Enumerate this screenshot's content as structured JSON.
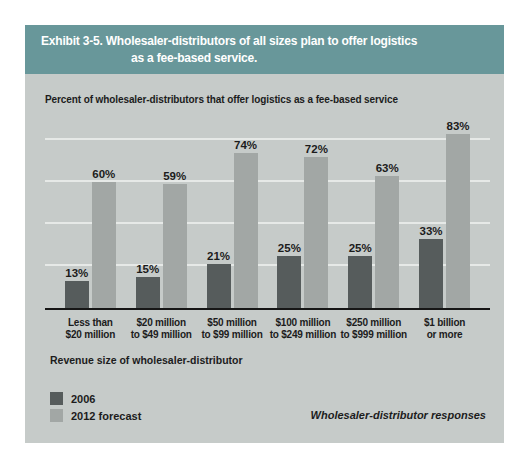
{
  "exhibit": {
    "title_line1": "Exhibit 3-5. Wholesaler-distributors of all sizes plan to offer logistics",
    "title_line2": "as a fee-based service."
  },
  "subtitle": "Percent of wholesaler-distributors that offer logistics as a fee-based service",
  "note": "Wholesaler-distributor responses",
  "colors": {
    "header_bg": "#68979a",
    "header_text": "#ffffff",
    "panel_bg": "#c6cbc9",
    "bar_2006": "#565c5c",
    "bar_2012_forecast": "#a2a7a5",
    "gridline": "#e6e9e7",
    "axis_line": "#161616",
    "text": "#1c1c1c"
  },
  "chart_data": {
    "type": "bar",
    "title": "Exhibit 3-5. Wholesaler-distributors of all sizes plan to offer logistics as a fee-based service.",
    "subtitle": "Percent of wholesaler-distributors that offer logistics as a fee-based service",
    "xlabel": "Revenue size of wholesaler-distributor",
    "ylabel": "",
    "categories": [
      "Less than $20 million",
      "$20 million to $49 million",
      "$50 million to $99 million",
      "$100 million to $249 million",
      "$250 million to $999 million",
      "$1 billion or more"
    ],
    "category_lines": [
      [
        "Less than",
        "$20 million"
      ],
      [
        "$20 million",
        "to $49 million"
      ],
      [
        "$50 million",
        "to $99 million"
      ],
      [
        "$100 million",
        "to $249 million"
      ],
      [
        "$250 million",
        "to $999 million"
      ],
      [
        "$1 billion",
        "or more"
      ]
    ],
    "series": [
      {
        "name": "2006",
        "values": [
          13,
          15,
          21,
          25,
          25,
          33
        ],
        "color": "#565c5c"
      },
      {
        "name": "2012 forecast",
        "values": [
          60,
          59,
          74,
          72,
          63,
          83
        ],
        "color": "#a2a7a5"
      }
    ],
    "value_suffix": "%",
    "ylim": [
      0,
      100
    ],
    "grid": true,
    "gridlines": [
      20,
      40,
      60,
      80
    ],
    "legend_position": "bottom-left",
    "annotation": "Wholesaler-distributor responses"
  }
}
